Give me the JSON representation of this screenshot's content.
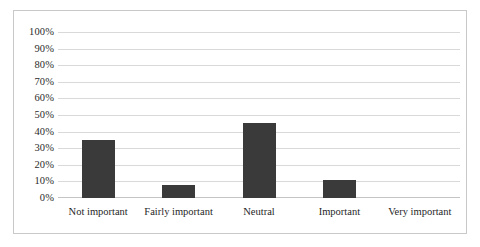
{
  "chart_data": {
    "type": "bar",
    "title": "",
    "subtitle": "",
    "xlabel": "",
    "ylabel": "",
    "categories": [
      "Not important",
      "Fairly important",
      "Neutral",
      "Important",
      "Very important"
    ],
    "values": [
      35,
      8,
      45,
      11,
      0
    ],
    "value_labels": [
      "35%",
      "8%",
      "45%",
      "11%",
      "0%"
    ],
    "ylim": [
      0,
      100
    ],
    "y_tick_labels": [
      "100%",
      "90%",
      "80%",
      "70%",
      "60%",
      "50%",
      "40%",
      "30%",
      "20%",
      "10%",
      "0%"
    ],
    "y_tick_values": [
      100,
      90,
      80,
      70,
      60,
      50,
      40,
      30,
      20,
      10,
      0
    ],
    "grid": true,
    "grid_axis": "y",
    "legend": false,
    "legend_position": "none",
    "series": [
      {
        "name": "",
        "values": [
          35,
          8,
          45,
          11,
          0
        ]
      }
    ]
  },
  "style": {
    "bar_color": "#3a3a3a",
    "gridline_color": "#d9d9d9",
    "baseline_color": "#c4c4c4",
    "border_color": "#c9c9c9",
    "background_color": "#ffffff",
    "text_color": "#1f1f1f"
  }
}
